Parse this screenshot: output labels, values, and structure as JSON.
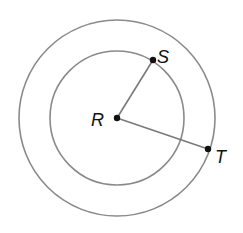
{
  "diagram": {
    "title": "",
    "center": {
      "label": "R",
      "x": 117,
      "y": 118,
      "label_x": 91,
      "label_y": 126
    },
    "circles": [
      {
        "name": "inner",
        "cx": 117,
        "cy": 118,
        "r": 67
      },
      {
        "name": "outer",
        "cx": 117,
        "cy": 118,
        "r": 98
      }
    ],
    "points": [
      {
        "label": "S",
        "x": 153,
        "y": 60,
        "label_x": 157,
        "label_y": 63,
        "on": "inner"
      },
      {
        "label": "T",
        "x": 208,
        "y": 149,
        "label_x": 215,
        "label_y": 163,
        "on": "outer"
      }
    ],
    "segments": [
      {
        "from": "R",
        "to": "S"
      },
      {
        "from": "R",
        "to": "T"
      }
    ],
    "colors": {
      "circle": "#8a8a8a",
      "segment": "#7a7a7a",
      "point": "#111111",
      "text": "#111111"
    }
  }
}
